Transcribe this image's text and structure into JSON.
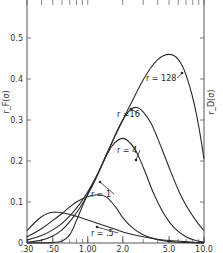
{
  "chart_data": {
    "type": "line",
    "title": "",
    "xlabel": "",
    "ylabel": "r_F(σ)",
    "ylabel_right": "r_D(σ)",
    "xscale": "log",
    "xlim": [
      0.3,
      10.0
    ],
    "ylim": [
      0,
      0.6
    ],
    "grid": false,
    "legend": "inline labels",
    "x_ticks": [
      {
        "value": 0.3,
        "label": ".30"
      },
      {
        "value": 0.5,
        "label": ".50"
      },
      {
        "value": 1.0,
        "label": "1.00"
      },
      {
        "value": 2.0,
        "label": "2.0"
      },
      {
        "value": 5.0,
        "label": "5.0"
      },
      {
        "value": 10.0,
        "label": "10.0"
      }
    ],
    "y_ticks": [
      {
        "value": 0,
        "label": "0"
      },
      {
        "value": 0.1,
        "label": "0.1"
      },
      {
        "value": 0.2,
        "label": "0.2"
      },
      {
        "value": 0.3,
        "label": "0.3"
      },
      {
        "value": 0.4,
        "label": "0.4"
      },
      {
        "value": 0.5,
        "label": "0.5"
      }
    ],
    "series": [
      {
        "name": "r = .5",
        "label": "r = .5",
        "x": [
          0.3,
          0.35,
          0.4,
          0.45,
          0.5,
          0.55,
          0.65,
          0.8,
          1.0,
          1.3,
          1.7,
          2.2,
          3.0,
          4.0,
          5.0,
          6.5,
          8.0,
          10.0
        ],
        "y": [
          0.03,
          0.05,
          0.064,
          0.072,
          0.075,
          0.075,
          0.072,
          0.065,
          0.056,
          0.045,
          0.034,
          0.024,
          0.015,
          0.009,
          0.006,
          0.004,
          0.002,
          0.001
        ]
      },
      {
        "name": "r = 1",
        "label": "r = 1",
        "x": [
          0.3,
          0.4,
          0.5,
          0.6,
          0.7,
          0.8,
          0.9,
          1.0,
          1.15,
          1.3,
          1.45,
          1.6,
          1.8,
          2.0,
          2.4,
          3.0,
          4.0,
          5.0,
          6.0,
          8.0,
          10.0
        ],
        "y": [
          0.015,
          0.035,
          0.055,
          0.072,
          0.088,
          0.1,
          0.108,
          0.113,
          0.117,
          0.117,
          0.112,
          0.1,
          0.082,
          0.062,
          0.038,
          0.02,
          0.008,
          0.004,
          0.002,
          0.001,
          0.0
        ]
      },
      {
        "name": "r = 4",
        "label": "r = 4",
        "x": [
          0.3,
          0.4,
          0.5,
          0.6,
          0.7,
          0.85,
          1.0,
          1.2,
          1.4,
          1.6,
          1.8,
          2.0,
          2.2,
          2.5,
          2.8,
          3.2,
          3.7,
          4.5,
          5.5,
          7.0,
          8.5,
          10.0
        ],
        "y": [
          0.007,
          0.018,
          0.032,
          0.048,
          0.066,
          0.095,
          0.125,
          0.165,
          0.205,
          0.235,
          0.25,
          0.255,
          0.25,
          0.232,
          0.205,
          0.165,
          0.12,
          0.072,
          0.038,
          0.015,
          0.006,
          0.002
        ]
      },
      {
        "name": "r = 16",
        "label": "r = 16",
        "x": [
          0.3,
          0.4,
          0.5,
          0.6,
          0.7,
          0.85,
          1.0,
          1.2,
          1.5,
          1.8,
          2.1,
          2.4,
          2.7,
          3.0,
          3.5,
          4.0,
          5.0,
          6.0,
          7.0,
          8.5,
          10.0
        ],
        "y": [
          0.002,
          0.007,
          0.017,
          0.032,
          0.052,
          0.085,
          0.118,
          0.163,
          0.225,
          0.275,
          0.31,
          0.328,
          0.33,
          0.32,
          0.292,
          0.255,
          0.185,
          0.13,
          0.092,
          0.055,
          0.03
        ]
      },
      {
        "name": "r = 128",
        "label": "r = 128",
        "x": [
          0.3,
          0.5,
          0.6,
          0.7,
          0.8,
          0.9,
          1.0,
          1.2,
          1.5,
          2.0,
          2.5,
          3.0,
          3.5,
          4.0,
          4.5,
          5.0,
          5.5,
          6.0,
          6.5,
          7.0,
          8.0,
          9.0,
          10.0
        ],
        "y": [
          0.0,
          0.001,
          0.005,
          0.02,
          0.055,
          0.09,
          0.12,
          0.165,
          0.225,
          0.3,
          0.355,
          0.398,
          0.428,
          0.447,
          0.457,
          0.46,
          0.457,
          0.448,
          0.432,
          0.41,
          0.355,
          0.285,
          0.205
        ]
      }
    ],
    "label_positions": [
      {
        "series": "r = 128",
        "text": "r = 128",
        "x": 146,
        "y": 81,
        "arrow_to": [
          182,
          73
        ]
      },
      {
        "series": "r = 16",
        "text": "r =16",
        "x": 117,
        "y": 117,
        "arrow_to": [
          131,
          109
        ]
      },
      {
        "series": "r = 4",
        "text": "r = 4",
        "x": 117,
        "y": 153,
        "arrow_to": [
          136,
          160
        ]
      },
      {
        "series": "r = 1",
        "text": "r = 1",
        "x": 91,
        "y": 197,
        "arrow_to": [
          100,
          182
        ]
      },
      {
        "series": "r = .5",
        "text": "r = .5",
        "x": 91,
        "y": 236,
        "arrow_to": [
          97,
          227
        ]
      }
    ],
    "colors": {
      "line": "#2a2a2a",
      "axis": "#555555",
      "background": "#ffffff"
    }
  }
}
